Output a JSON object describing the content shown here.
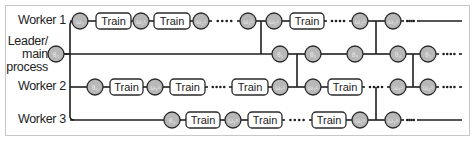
{
  "diagram": {
    "colors": {
      "line": "#1e1e1e",
      "circle_fill": "#b8b8b8",
      "circle_stroke": "#2a2a2a",
      "box_fill": "#ffffff",
      "box_stroke": "#2a2a2a",
      "border": "#c8c8c8",
      "text": "#222222",
      "circle_text": "#e8e8e8"
    },
    "lanes": [
      {
        "id": "worker1",
        "label": "Worker 1",
        "y": 21
      },
      {
        "id": "leader",
        "label": "Leader/\nmain\nprocess",
        "label_lines": [
          "Leader/",
          "main",
          "process"
        ],
        "y": 54
      },
      {
        "id": "worker2",
        "label": "Worker 2",
        "y": 87
      },
      {
        "id": "worker3",
        "label": "Worker 3",
        "y": 120
      }
    ],
    "train_label": "Train",
    "spine_x": 70,
    "rows": [
      {
        "lane": "worker1",
        "items": [
          {
            "type": "line",
            "x1": 70,
            "x2": 72
          },
          {
            "type": "circle",
            "x": 80,
            "text": "ω₀"
          },
          {
            "type": "line",
            "x1": 88,
            "x2": 96
          },
          {
            "type": "box",
            "x1": 96,
            "x2": 131,
            "text": "Train"
          },
          {
            "type": "line",
            "x1": 131,
            "x2": 133
          },
          {
            "type": "circle",
            "x": 141,
            "text": "ω₁¹"
          },
          {
            "type": "line",
            "x1": 149,
            "x2": 154
          },
          {
            "type": "box",
            "x1": 154,
            "x2": 190,
            "text": "Train"
          },
          {
            "type": "line",
            "x1": 190,
            "x2": 193
          },
          {
            "type": "circle",
            "x": 201,
            "text": "ω₂¹"
          },
          {
            "type": "dots",
            "x1": 209,
            "x2": 240
          },
          {
            "type": "circle",
            "x": 248,
            "text": "ω₁¹"
          },
          {
            "type": "line",
            "x1": 256,
            "x2": 266
          },
          {
            "type": "circle",
            "x": 274,
            "text": "ω₀¹"
          },
          {
            "type": "line",
            "x1": 282,
            "x2": 290
          },
          {
            "type": "box",
            "x1": 290,
            "x2": 324,
            "text": "Train"
          },
          {
            "type": "dots",
            "x1": 324,
            "x2": 352
          },
          {
            "type": "circle",
            "x": 360,
            "text": "ω₂¹"
          },
          {
            "type": "line",
            "x1": 368,
            "x2": 385
          },
          {
            "type": "circle",
            "x": 393,
            "text": "ω₀¹"
          },
          {
            "type": "dots",
            "x1": 401,
            "x2": 420
          },
          {
            "type": "line",
            "x1": 420,
            "x2": 462
          }
        ]
      },
      {
        "lane": "leader",
        "items": [
          {
            "type": "circle",
            "x": 56,
            "text": "θ₀"
          },
          {
            "type": "line",
            "x1": 64,
            "x2": 272
          },
          {
            "type": "circle",
            "x": 280,
            "text": "θ₁"
          },
          {
            "type": "line",
            "x1": 288,
            "x2": 305
          },
          {
            "type": "circle",
            "x": 313,
            "text": "θ₂"
          },
          {
            "type": "line",
            "x1": 321,
            "x2": 347
          },
          {
            "type": "circle",
            "x": 355,
            "text": "θ₃"
          },
          {
            "type": "line",
            "x1": 363,
            "x2": 390
          },
          {
            "type": "circle",
            "x": 398,
            "text": "θ₄"
          },
          {
            "type": "line",
            "x1": 406,
            "x2": 420
          },
          {
            "type": "circle",
            "x": 428,
            "text": "θ₅"
          },
          {
            "type": "dots",
            "x1": 436,
            "x2": 462
          }
        ]
      },
      {
        "lane": "worker2",
        "items": [
          {
            "type": "line",
            "x1": 70,
            "x2": 87
          },
          {
            "type": "circle",
            "x": 95,
            "text": "θ₀"
          },
          {
            "type": "line",
            "x1": 103,
            "x2": 110
          },
          {
            "type": "box",
            "x1": 110,
            "x2": 143,
            "text": "Train"
          },
          {
            "type": "line",
            "x1": 143,
            "x2": 147
          },
          {
            "type": "circle",
            "x": 155,
            "text": "ω₁²"
          },
          {
            "type": "line",
            "x1": 163,
            "x2": 170
          },
          {
            "type": "box",
            "x1": 170,
            "x2": 205,
            "text": "Train"
          },
          {
            "type": "dots",
            "x1": 205,
            "x2": 232
          },
          {
            "type": "box",
            "x1": 232,
            "x2": 268,
            "text": "Train"
          },
          {
            "type": "line",
            "x1": 268,
            "x2": 272
          },
          {
            "type": "circle",
            "x": 280,
            "text": "ω₁²"
          },
          {
            "type": "line",
            "x1": 288,
            "x2": 305
          },
          {
            "type": "circle",
            "x": 313,
            "text": "ω₂²"
          },
          {
            "type": "line",
            "x1": 321,
            "x2": 328
          },
          {
            "type": "box",
            "x1": 328,
            "x2": 362,
            "text": "Train"
          },
          {
            "type": "dots",
            "x1": 362,
            "x2": 390
          },
          {
            "type": "circle",
            "x": 398,
            "text": "ω₃²"
          },
          {
            "type": "line",
            "x1": 406,
            "x2": 420
          },
          {
            "type": "circle",
            "x": 428,
            "text": "ω₄²"
          },
          {
            "type": "dots",
            "x1": 436,
            "x2": 462
          }
        ]
      },
      {
        "lane": "worker3",
        "items": [
          {
            "type": "line",
            "x1": 70,
            "x2": 164
          },
          {
            "type": "circle",
            "x": 172,
            "text": "θ₀"
          },
          {
            "type": "line",
            "x1": 180,
            "x2": 186
          },
          {
            "type": "box",
            "x1": 186,
            "x2": 220,
            "text": "Train"
          },
          {
            "type": "line",
            "x1": 220,
            "x2": 225
          },
          {
            "type": "circle",
            "x": 233,
            "text": "ω₁³"
          },
          {
            "type": "line",
            "x1": 241,
            "x2": 248
          },
          {
            "type": "box",
            "x1": 248,
            "x2": 282,
            "text": "Train"
          },
          {
            "type": "dots",
            "x1": 282,
            "x2": 312
          },
          {
            "type": "box",
            "x1": 312,
            "x2": 346,
            "text": "Train"
          },
          {
            "type": "line",
            "x1": 346,
            "x2": 352
          },
          {
            "type": "circle",
            "x": 360,
            "text": "ω₁³"
          },
          {
            "type": "line",
            "x1": 368,
            "x2": 385
          },
          {
            "type": "circle",
            "x": 393,
            "text": "ω₂³"
          },
          {
            "type": "dots",
            "x1": 401,
            "x2": 420
          },
          {
            "type": "line",
            "x1": 420,
            "x2": 462
          }
        ]
      }
    ],
    "connectors": [
      {
        "from_lane": "worker1",
        "to_lane": "leader",
        "x": 261,
        "y1": 21,
        "y2": 54
      },
      {
        "from_lane": "leader",
        "to_lane": "worker2",
        "x": 297,
        "y1": 54,
        "y2": 87
      },
      {
        "from_lane": "worker1",
        "to_lane": "leader",
        "x": 376,
        "y1": 21,
        "y2": 54
      },
      {
        "from_lane": "worker2",
        "to_lane": "worker3",
        "x": 376,
        "y1": 87,
        "y2": 120
      },
      {
        "from_lane": "leader",
        "to_lane": "worker2",
        "x": 413,
        "y1": 54,
        "y2": 87
      }
    ]
  }
}
